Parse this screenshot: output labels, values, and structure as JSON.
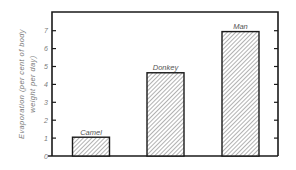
{
  "chart_data": {
    "type": "bar",
    "title": "",
    "xlabel": "",
    "ylabel_lines": [
      "Evaporation (per cent of body",
      "weight per day)"
    ],
    "categories": [
      "Camel",
      "Donkey",
      "Man"
    ],
    "values": [
      1.05,
      4.65,
      6.95
    ],
    "ylim": [
      0,
      8
    ],
    "yticks": [
      0,
      1,
      2,
      3,
      4,
      5,
      6,
      7
    ],
    "right_axis_ticks": [
      1,
      2,
      3,
      4,
      5,
      6,
      7
    ],
    "grid": false,
    "bar_fill": "hatched",
    "data_labels": [
      "Camel",
      "Donkey",
      "Man"
    ]
  }
}
